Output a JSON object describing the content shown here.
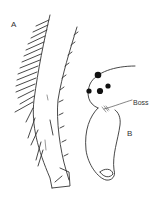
{
  "figure": {
    "labels": {
      "a": "A",
      "b": "B",
      "boss": "Boss"
    },
    "parts": {
      "a": "bristled-appendage-segment",
      "b": "head-with-boss"
    },
    "colors": {
      "line": "#333333",
      "background": "#ffffff",
      "spots": "#111111"
    }
  }
}
